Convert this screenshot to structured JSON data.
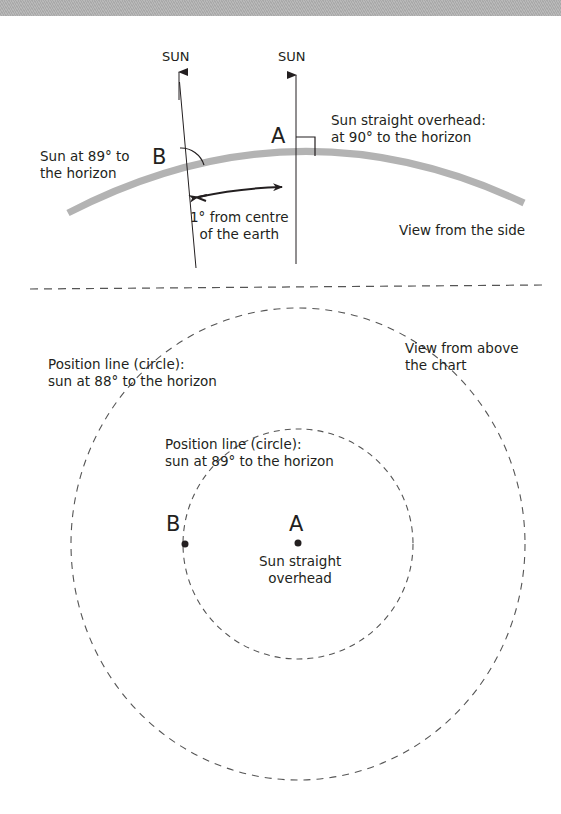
{
  "side_view": {
    "sun_label_b": "SUN",
    "sun_label_a": "SUN",
    "point_a": "A",
    "point_b": "B",
    "sun_b_caption_line1": "Sun at 89° to",
    "sun_b_caption_line2": "the horizon",
    "sun_a_caption_line1": "Sun straight overhead:",
    "sun_a_caption_line2": "at 90° to the horizon",
    "angle_caption_line1": "1° from centre",
    "angle_caption_line2": "of the earth",
    "view_caption": "View from the side",
    "earth_color": "#b3b3b3"
  },
  "top_view": {
    "outer_circle_line1": "Position line (circle):",
    "outer_circle_line2": "sun at 88° to the horizon",
    "inner_circle_line1": "Position line (circle):",
    "inner_circle_line2": "sun at 89° to the horizon",
    "view_caption_line1": "View from above",
    "view_caption_line2": "the chart",
    "point_a": "A",
    "point_b": "B",
    "center_caption_line1": "Sun straight",
    "center_caption_line2": "overhead",
    "dash_color": "#555555"
  }
}
